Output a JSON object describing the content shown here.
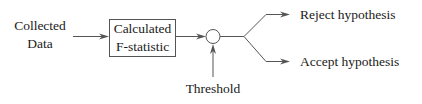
{
  "diagram": {
    "nodes": {
      "input": {
        "line1": "Collected",
        "line2": "Data"
      },
      "process": {
        "line1": "Calculated",
        "line2": "F-statistic"
      },
      "comparator": {
        "shape": "circle"
      },
      "threshold": {
        "label": "Threshold"
      },
      "output_reject": {
        "label": "Reject hypothesis"
      },
      "output_accept": {
        "label": "Accept hypothesis"
      }
    },
    "edges": [
      {
        "from": "input",
        "to": "process"
      },
      {
        "from": "process",
        "to": "comparator"
      },
      {
        "from": "threshold",
        "to": "comparator"
      },
      {
        "from": "comparator",
        "to": "output_reject"
      },
      {
        "from": "comparator",
        "to": "output_accept"
      }
    ],
    "colors": {
      "line": "#555555",
      "text": "#1a1a1a",
      "background": "#ffffff"
    }
  }
}
